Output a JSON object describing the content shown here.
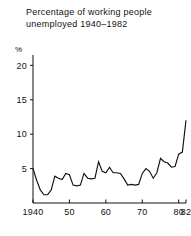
{
  "chart_data": {
    "type": "line",
    "title_lines": [
      "Percentage of working people",
      "unemployed 1940–1982"
    ],
    "xlabel": "",
    "ylabel": "%",
    "ylim": [
      0,
      21.5
    ],
    "xlim": [
      1940,
      1982
    ],
    "grid": false,
    "legend": false,
    "line_color": "#111111",
    "background_color": "#ffffff",
    "y_ticks": [
      5,
      10,
      15,
      20
    ],
    "y_tick_labels": [
      "5",
      "10",
      "15",
      "20"
    ],
    "x_ticks": [
      1940,
      1950,
      1960,
      1970,
      1980,
      1982
    ],
    "x_tick_labels": [
      "1940",
      "50",
      "60",
      "70",
      "80",
      "82"
    ],
    "x": [
      1940,
      1941,
      1942,
      1943,
      1944,
      1945,
      1946,
      1947,
      1948,
      1949,
      1950,
      1951,
      1952,
      1953,
      1954,
      1955,
      1956,
      1957,
      1958,
      1959,
      1960,
      1961,
      1962,
      1963,
      1964,
      1965,
      1966,
      1967,
      1968,
      1969,
      1970,
      1971,
      1972,
      1973,
      1974,
      1975,
      1976,
      1977,
      1978,
      1979,
      1980,
      1981,
      1982
    ],
    "values": [
      5.0,
      3.3,
      1.9,
      1.2,
      1.2,
      1.9,
      3.9,
      3.6,
      3.4,
      4.3,
      4.1,
      2.6,
      2.5,
      2.6,
      4.3,
      3.6,
      3.5,
      3.6,
      6.0,
      4.6,
      4.4,
      5.2,
      4.4,
      4.4,
      4.3,
      3.5,
      2.6,
      2.7,
      2.6,
      2.7,
      4.3,
      5.0,
      4.6,
      3.6,
      4.4,
      6.5,
      6.0,
      5.8,
      5.2,
      5.3,
      7.1,
      7.4,
      12.0
    ],
    "series_name": "Percentage unemployed",
    "annotations": []
  },
  "axis": {
    "unit_label": "%"
  }
}
